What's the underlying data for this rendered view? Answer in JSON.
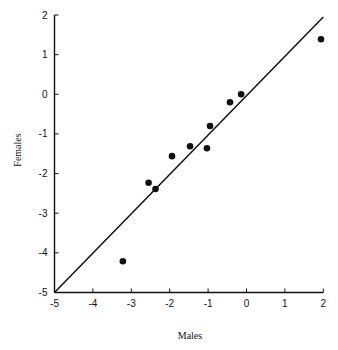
{
  "chart_data": {
    "type": "scatter",
    "title": "",
    "xlabel": "Males",
    "ylabel": "Females",
    "xlim": [
      -5,
      2
    ],
    "ylim": [
      -5,
      2
    ],
    "xticks": [
      -5,
      -4,
      -3,
      -2,
      -1,
      0,
      1,
      2
    ],
    "yticks": [
      -5,
      -4,
      -3,
      -2,
      -1,
      0,
      1,
      2
    ],
    "xtick_labels": [
      "-5",
      "-4",
      "-3",
      "-2",
      "-1",
      "0",
      "1",
      "2"
    ],
    "ytick_labels": [
      "-5",
      "-4",
      "-3",
      "-2",
      "-1",
      "0",
      "1",
      "2"
    ],
    "grid": false,
    "legend": null,
    "series": [
      {
        "name": "points",
        "kind": "scatter",
        "color": "#111111",
        "x": [
          -3.22,
          -2.55,
          -2.37,
          -1.94,
          -1.47,
          -1.03,
          -0.95,
          -0.43,
          -0.14,
          1.94
        ],
        "y": [
          -4.21,
          -2.23,
          -2.39,
          -1.56,
          -1.31,
          -1.36,
          -0.8,
          -0.2,
          0.0,
          1.39
        ]
      },
      {
        "name": "identity line",
        "kind": "line",
        "color": "#111111",
        "x": [
          -5,
          2
        ],
        "y": [
          -5,
          1.95
        ]
      }
    ]
  },
  "plot": {
    "x0_px": 54.5,
    "x1_px": 323.3,
    "y0_px": 292.5,
    "y1_px": 15
  }
}
